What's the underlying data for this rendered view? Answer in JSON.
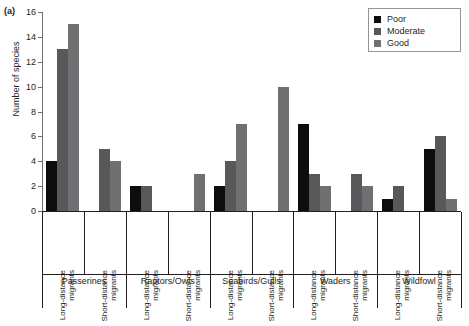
{
  "panel": {
    "label": "(a)"
  },
  "chart_data": {
    "type": "bar",
    "title": "",
    "xlabel": "",
    "ylabel": "Number of species",
    "ylim": [
      0,
      16
    ],
    "yticks": [
      0,
      2,
      4,
      6,
      8,
      10,
      12,
      14,
      16
    ],
    "grid": false,
    "legend_position": "top-right",
    "legend": [
      "Poor",
      "Moderate",
      "Good"
    ],
    "series": [
      {
        "name": "Poor",
        "color": "#0d0d0d",
        "values": [
          4,
          0,
          2,
          0,
          2,
          0,
          7,
          0,
          1,
          5
        ]
      },
      {
        "name": "Moderate",
        "color": "#58585a",
        "values": [
          13,
          5,
          2,
          0,
          4,
          0,
          3,
          3,
          2,
          6
        ]
      },
      {
        "name": "Good",
        "color": "#6f7072",
        "values": [
          15,
          4,
          0,
          3,
          7,
          10,
          2,
          2,
          0,
          1
        ]
      }
    ],
    "categories": [
      "Long-distance migrants",
      "Short-distance migrants",
      "Long-distance migrants",
      "Short-distance migrants",
      "Long-distance migrants",
      "Short-distance migrants",
      "Long-distance migrants",
      "Short-distance migrants",
      "Long-distance migrants",
      "Short-distance migrants"
    ],
    "category_lines": [
      [
        "Long-distance",
        "migrants"
      ],
      [
        "Short-distance",
        "migrants"
      ],
      [
        "Long-distance",
        "migrants"
      ],
      [
        "Short-distance",
        "migrants"
      ],
      [
        "Long-distance",
        "migrants"
      ],
      [
        "Short-distance",
        "migrants"
      ],
      [
        "Long-distance",
        "migrants"
      ],
      [
        "Short-distance",
        "migrants"
      ],
      [
        "Long-distance",
        "migrants"
      ],
      [
        "Short-distance",
        "migrants"
      ]
    ],
    "families": [
      {
        "name": "Passerines",
        "groups": 2
      },
      {
        "name": "Raptors/Owls",
        "groups": 2
      },
      {
        "name": "Seabirds/Gulls",
        "groups": 2
      },
      {
        "name": "Waders",
        "groups": 2
      },
      {
        "name": "Wildfowl",
        "groups": 2
      }
    ]
  },
  "legend_items": [
    {
      "label": "Poor",
      "color": "#0d0d0d",
      "key": "poor"
    },
    {
      "label": "Moderate",
      "color": "#58585a",
      "key": "moderate"
    },
    {
      "label": "Good",
      "color": "#6f7072",
      "key": "good"
    }
  ]
}
